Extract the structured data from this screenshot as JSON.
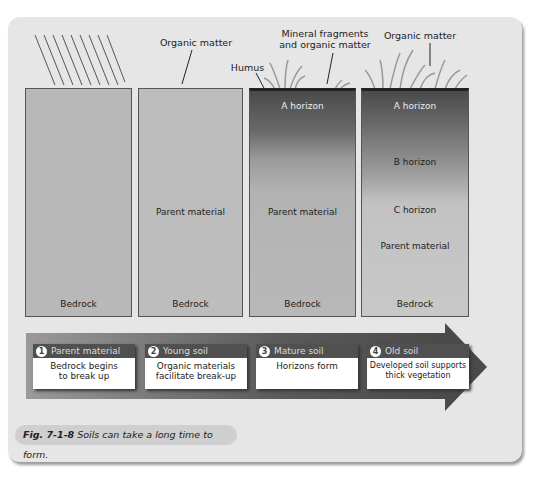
{
  "annotations": {
    "organic_matter_1": "Organic matter",
    "humus": "Humus",
    "mineral_fragments_line1": "Mineral fragments",
    "mineral_fragments_line2": "and organic matter",
    "organic_matter_2": "Organic matter"
  },
  "columns": [
    {
      "labels": {
        "bottom": "Bedrock"
      }
    },
    {
      "labels": {
        "middle": "Parent material",
        "bottom": "Bedrock"
      }
    },
    {
      "labels": {
        "a": "A horizon",
        "middle": "Parent material",
        "bottom": "Bedrock"
      }
    },
    {
      "labels": {
        "a": "A horizon",
        "b": "B horizon",
        "c": "C horizon",
        "parent": "Parent material",
        "bottom": "Bedrock"
      }
    }
  ],
  "stages": [
    {
      "num": "1",
      "title": "Parent material",
      "line1": "Bedrock begins",
      "line2": "to break up"
    },
    {
      "num": "2",
      "title": "Young soil",
      "line1": "Organic materials",
      "line2": "facilitate break-up"
    },
    {
      "num": "3",
      "title": "Mature soil",
      "line1": "Horizons form",
      "line2": ""
    },
    {
      "num": "4",
      "title": "Old soil",
      "line1": "Developed soil supports",
      "line2": "thick vegetation"
    }
  ],
  "caption": {
    "fig": "Fig. 7-1-8",
    "text": "Soils can take a long time to form."
  },
  "colors": {
    "panel": "#e6e6e6",
    "arrow": "#4a4a4a",
    "stage_header": "#505050"
  }
}
